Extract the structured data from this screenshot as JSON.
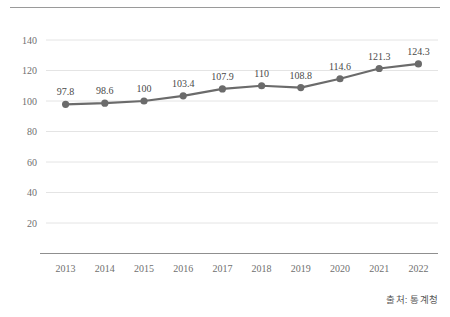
{
  "figure": {
    "width": 450,
    "height": 317,
    "background": "#ffffff",
    "top_rule_color": "#9a9a9a"
  },
  "source": {
    "label": "출처: 통계청"
  },
  "style": {
    "line_color": "#6b6b6b",
    "marker_color": "#6b6b6b",
    "grid_color": "#e4e4e4",
    "axis_color": "#8f8f8f",
    "tick_text_color": "#6f6f6f",
    "data_label_color": "#4a4a4a"
  },
  "chart_data": {
    "type": "line",
    "title": "",
    "subtitle": "",
    "xlabel": "",
    "ylabel": "",
    "categories": [
      "2013",
      "2014",
      "2015",
      "2016",
      "2017",
      "2018",
      "2019",
      "2020",
      "2021",
      "2022"
    ],
    "values": [
      97.8,
      98.6,
      100,
      103.4,
      107.9,
      110,
      108.8,
      114.6,
      121.3,
      124.3
    ],
    "data_labels": [
      "97.8",
      "98.6",
      "100",
      "103.4",
      "107.9",
      "110",
      "108.8",
      "114.6",
      "121.3",
      "124.3"
    ],
    "ylim": [
      0,
      150
    ],
    "yticks": [
      20,
      40,
      60,
      80,
      100,
      120,
      140
    ],
    "ytick_labels": [
      "20",
      "40",
      "60",
      "80",
      "100",
      "120",
      "140"
    ],
    "grid": "horizontal",
    "legend": "none",
    "series": [
      {
        "name": "index",
        "values": [
          97.8,
          98.6,
          100,
          103.4,
          107.9,
          110,
          108.8,
          114.6,
          121.3,
          124.3
        ]
      }
    ],
    "annotations": [
      "출처: 통계청"
    ]
  }
}
